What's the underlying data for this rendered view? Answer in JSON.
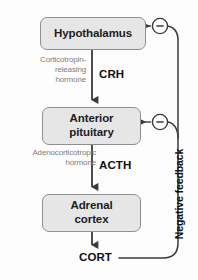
{
  "diagram": {
    "background_color": "#fdfdfd",
    "node_fill_color": "#e6e6e6",
    "node_border_color": "#8f8f8f",
    "arrow_color": "#3a3a3a",
    "muted_text_color": "#7d7d7d",
    "nodes": [
      {
        "id": "hypothalamus",
        "label": "Hypothalamus"
      },
      {
        "id": "anterior-pituitary",
        "label": "Anterior\npituitary",
        "line1": "Anterior",
        "line2": "pituitary"
      },
      {
        "id": "adrenal-cortex",
        "label": "Adrenal\ncortex",
        "line1": "Adrenal",
        "line2": "cortex"
      }
    ],
    "hormones": [
      {
        "id": "crh",
        "abbrev": "CRH",
        "full_name_line1": "Corticotropin-",
        "full_name_line2": "releasing",
        "full_name_line3": "hormone",
        "full_name": "Corticotropin-releasing hormone"
      },
      {
        "id": "acth",
        "abbrev": "ACTH",
        "full_name_line1": "Adenocorticotropic",
        "full_name_line2": "hormone",
        "full_name": "Adenocorticotropic hormone"
      },
      {
        "id": "cort",
        "abbrev": "CORT",
        "full_name": ""
      }
    ],
    "feedback": {
      "label": "Negative feedback",
      "sign_symbol": "−",
      "sign_count": 2,
      "targets": [
        "hypothalamus",
        "anterior-pituitary"
      ]
    }
  }
}
